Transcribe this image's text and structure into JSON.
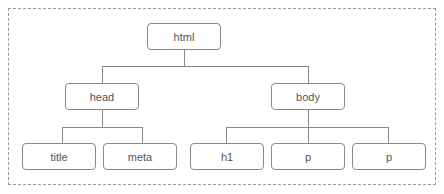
{
  "diagram": {
    "type": "tree",
    "title": "",
    "nodes": {
      "root": {
        "label": "html"
      },
      "head": {
        "label": "head"
      },
      "body": {
        "label": "body"
      },
      "title": {
        "label": "title"
      },
      "meta": {
        "label": "meta"
      },
      "h1": {
        "label": "h1"
      },
      "p1": {
        "label": "p"
      },
      "p2": {
        "label": "p"
      }
    },
    "edges": [
      [
        "html",
        "head"
      ],
      [
        "html",
        "body"
      ],
      [
        "head",
        "title"
      ],
      [
        "head",
        "meta"
      ],
      [
        "body",
        "h1"
      ],
      [
        "body",
        "p"
      ],
      [
        "body",
        "p"
      ]
    ],
    "colors": {
      "stroke": "#8a8a8a",
      "text": "#555555",
      "frame": "#9a9a9a"
    }
  }
}
